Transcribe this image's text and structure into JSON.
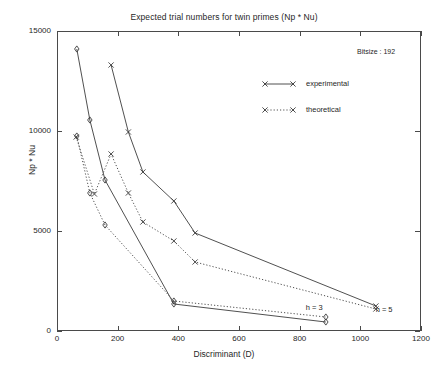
{
  "chart_data": {
    "type": "line",
    "title": "Expected trial numbers for twin primes (Np * Nu)",
    "xlabel": "Discriminant (D)",
    "ylabel": "Np * Nu",
    "xlim": [
      0,
      1200
    ],
    "ylim": [
      0,
      15000
    ],
    "xticks": [
      0,
      200,
      400,
      600,
      800,
      1000,
      1200
    ],
    "yticks": [
      0,
      5000,
      10000,
      15000
    ],
    "grid": false,
    "legend_position": "upper-right-inside",
    "annotation": "Bitsize : 192",
    "legend": [
      {
        "name": "experimental",
        "style": "solid",
        "marker": "x"
      },
      {
        "name": "theoretical",
        "style": "dotted",
        "marker": "x"
      }
    ],
    "curve_labels": [
      {
        "text": "h = 3",
        "x": 860,
        "y": 1150
      },
      {
        "text": "h = 5",
        "x": 1090,
        "y": 1050
      }
    ],
    "series": [
      {
        "name": "h=5 experimental",
        "group": "h = 5",
        "style": "solid",
        "marker": "x",
        "x": [
          175,
          232,
          280,
          382,
          452,
          1048
        ],
        "y": [
          13350,
          10000,
          8000,
          6550,
          4950,
          1300
        ]
      },
      {
        "name": "h=5 theoretical",
        "group": "h = 5",
        "style": "dotted",
        "marker": "x",
        "x": [
          60,
          120,
          175,
          232,
          280,
          382,
          452,
          1048
        ],
        "y": [
          9750,
          6900,
          8900,
          6950,
          5500,
          4550,
          3500,
          1150
        ]
      },
      {
        "name": "h=3 experimental",
        "group": "h = 3",
        "style": "solid",
        "marker": "diamond",
        "x": [
          62,
          105,
          155,
          382,
          883
        ],
        "y": [
          14150,
          10600,
          7600,
          1400,
          500
        ]
      },
      {
        "name": "h=3 theoretical",
        "group": "h = 3",
        "style": "dotted",
        "marker": "diamond",
        "x": [
          62,
          105,
          155,
          382,
          883
        ],
        "y": [
          9800,
          6950,
          5350,
          1550,
          750
        ]
      }
    ]
  }
}
